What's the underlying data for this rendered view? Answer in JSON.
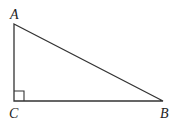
{
  "figure": {
    "type": "right-triangle",
    "stroke_color": "#333333",
    "vertices": {
      "A": {
        "label": "A",
        "x": 14,
        "y": 24
      },
      "B": {
        "label": "B",
        "x": 163,
        "y": 101
      },
      "C": {
        "label": "C",
        "x": 14,
        "y": 101
      }
    },
    "right_angle_at": "C",
    "right_angle_marker_size": 10
  }
}
